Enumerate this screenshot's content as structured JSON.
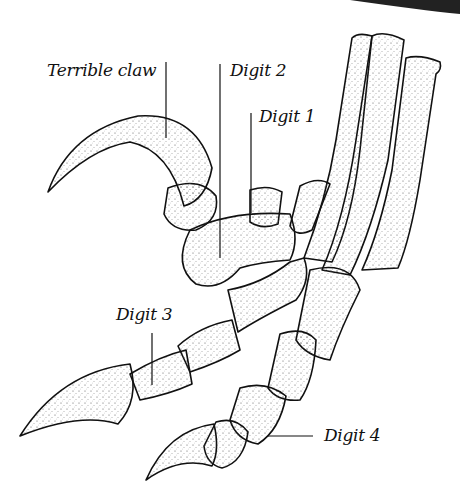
{
  "diagram": {
    "colors": {
      "ink": "#111111",
      "bone": "#ffffff",
      "stipple": "#555555"
    },
    "labels": [
      {
        "id": "terrible-claw",
        "text": "Terrible claw"
      },
      {
        "id": "digit-2",
        "text": "Digit 2"
      },
      {
        "id": "digit-1",
        "text": "Digit 1"
      },
      {
        "id": "digit-3",
        "text": "Digit 3"
      },
      {
        "id": "digit-4",
        "text": "Digit 4"
      }
    ]
  }
}
